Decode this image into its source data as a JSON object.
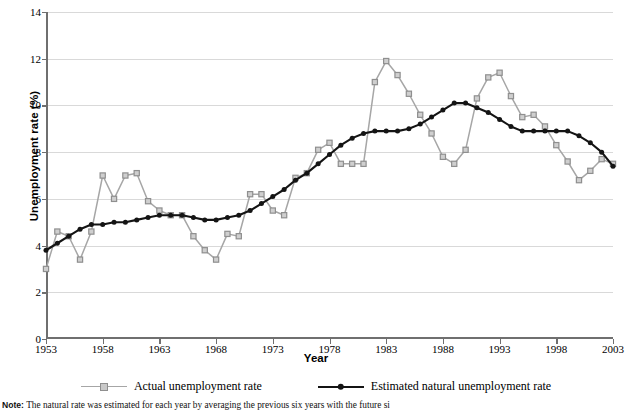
{
  "chart_data": {
    "type": "line",
    "title": "",
    "xlabel": "Year",
    "ylabel": "Unemployment rate (%)",
    "xlim": [
      1953,
      2003
    ],
    "ylim": [
      0,
      14
    ],
    "ytick_step": 2,
    "xtick_step": 5,
    "grid": true,
    "legend_position": "bottom",
    "yticks": [
      "0",
      "2",
      "4",
      "6",
      "8",
      "10",
      "12",
      "14"
    ],
    "xticks": [
      "1953",
      "1958",
      "1963",
      "1968",
      "1973",
      "1978",
      "1983",
      "1988",
      "1993",
      "1998",
      "2003"
    ],
    "x": [
      1953,
      1954,
      1955,
      1956,
      1957,
      1958,
      1959,
      1960,
      1961,
      1962,
      1963,
      1964,
      1965,
      1966,
      1967,
      1968,
      1969,
      1970,
      1971,
      1972,
      1973,
      1974,
      1975,
      1976,
      1977,
      1978,
      1979,
      1980,
      1981,
      1982,
      1983,
      1984,
      1985,
      1986,
      1987,
      1988,
      1989,
      1990,
      1991,
      1992,
      1993,
      1994,
      1995,
      1996,
      1997,
      1998,
      1999,
      2000,
      2001,
      2002,
      2003
    ],
    "series": [
      {
        "name": "Actual unemployment rate",
        "color": "#a6a6a6",
        "marker": "open-square",
        "values": [
          3.0,
          4.6,
          4.4,
          3.4,
          4.6,
          7.0,
          6.0,
          7.0,
          7.1,
          5.9,
          5.5,
          5.3,
          5.3,
          4.4,
          3.8,
          3.4,
          4.5,
          4.4,
          6.2,
          6.2,
          5.5,
          5.3,
          6.9,
          7.1,
          8.1,
          8.4,
          7.5,
          7.5,
          7.5,
          11.0,
          11.9,
          11.3,
          10.5,
          9.6,
          8.8,
          7.8,
          7.5,
          8.1,
          10.3,
          11.2,
          11.4,
          10.4,
          9.5,
          9.6,
          9.1,
          8.3,
          7.6,
          6.8,
          7.2,
          7.7,
          7.5
        ]
      },
      {
        "name": "Estimated natural unemployment rate",
        "color": "#141414",
        "marker": "filled-circle",
        "values": [
          3.8,
          4.1,
          4.4,
          4.7,
          4.9,
          4.9,
          5.0,
          5.0,
          5.1,
          5.2,
          5.3,
          5.3,
          5.3,
          5.2,
          5.1,
          5.1,
          5.2,
          5.3,
          5.5,
          5.8,
          6.1,
          6.4,
          6.8,
          7.1,
          7.5,
          7.9,
          8.3,
          8.6,
          8.8,
          8.9,
          8.9,
          8.9,
          9.0,
          9.2,
          9.5,
          9.8,
          10.1,
          10.1,
          9.9,
          9.7,
          9.4,
          9.1,
          8.9,
          8.9,
          8.9,
          8.9,
          8.9,
          8.7,
          8.4,
          8.0,
          7.4
        ]
      }
    ]
  },
  "legend": {
    "items": [
      {
        "label": "Actual unemployment rate"
      },
      {
        "label": "Estimated natural unemployment rate"
      }
    ]
  },
  "note": {
    "prefix": "Note:",
    "text": "The natural rate was estimated for each year by averaging the previous six years with the future si"
  }
}
